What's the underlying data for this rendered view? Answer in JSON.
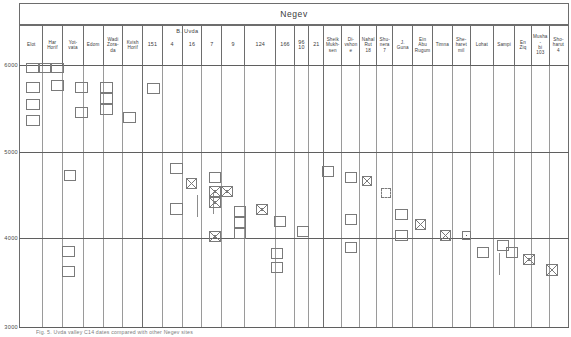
{
  "figure": {
    "title": "Negev",
    "caption": "Fig. 5. Uvda valley C14 dates compared with other Negev sites"
  },
  "axis": {
    "label": "cal BC",
    "ticks": [
      {
        "value": "6000",
        "y": 65
      },
      {
        "value": "5000",
        "y": 152
      },
      {
        "value": "4000",
        "y": 238
      },
      {
        "value": "3000",
        "y": 327
      }
    ],
    "ymin": 3000,
    "ymax": 6000,
    "gridlines": [
      65,
      152,
      238,
      327
    ]
  },
  "groups": [
    {
      "label": "B. Uvda",
      "x": 146,
      "width": 158
    }
  ],
  "columns": [
    {
      "name": "Elot",
      "label": "Elot",
      "x": 23,
      "width": 25,
      "numeric": false
    },
    {
      "name": "har-horif",
      "label": "Har\nHorif",
      "x": 48,
      "width": 25,
      "numeric": false
    },
    {
      "name": "yotvata",
      "label": "Yot-\nvata",
      "x": 73,
      "width": 25,
      "numeric": false
    },
    {
      "name": "edom",
      "label": "Edom",
      "x": 98,
      "width": 24,
      "numeric": false
    },
    {
      "name": "wadi-zora",
      "label": "Wadi\nZora-\nda",
      "x": 122,
      "width": 24,
      "numeric": false
    },
    {
      "name": "kvish-horif",
      "label": "Kvish\nHorif",
      "x": 146,
      "width": 24,
      "numeric": false
    },
    {
      "name": "uvda-151",
      "label": "151",
      "x": 170,
      "width": 24,
      "numeric": true
    },
    {
      "name": "uvda-4",
      "label": "4",
      "x": 194,
      "width": 24,
      "numeric": true
    },
    {
      "name": "uvda-16",
      "label": "16",
      "x": 218,
      "width": 24,
      "numeric": true
    },
    {
      "name": "uvda-7",
      "label": "7",
      "x": 242,
      "width": 24,
      "numeric": true
    },
    {
      "name": "uvda-9",
      "label": "9",
      "x": 266,
      "width": 28,
      "numeric": true
    },
    {
      "name": "uvda-124",
      "label": "124",
      "x": 294,
      "width": 38,
      "numeric": true
    },
    {
      "name": "uvda-166",
      "label": "166",
      "x": 332,
      "width": 22,
      "numeric": true
    },
    {
      "name": "uvda-96",
      "label": "96\n10",
      "x": 354,
      "width": 18,
      "numeric": true
    },
    {
      "name": "uvda-21",
      "label": "21",
      "x": 372,
      "width": 18,
      "numeric": true
    },
    {
      "name": "sheik-mukhsen",
      "label": "Sheik\nMukh-\nsen",
      "x": 390,
      "width": 22,
      "numeric": false
    },
    {
      "name": "divshone",
      "label": "Di-\nvshone",
      "x": 412,
      "width": 22,
      "numeric": false
    },
    {
      "name": "nahal-rut",
      "label": "Nahal\nRut\n18",
      "x": 434,
      "width": 20,
      "numeric": false
    },
    {
      "name": "shunera",
      "label": "Shu-\nnera\n7",
      "x": 454,
      "width": 20,
      "numeric": false
    },
    {
      "name": "j-guna",
      "label": "J.\nGuna",
      "x": 474,
      "width": 24,
      "numeric": false
    },
    {
      "name": "ein-abu-rugum",
      "label": "Ein\nAbu\nRugum",
      "x": 498,
      "width": 24,
      "numeric": false
    },
    {
      "name": "timna",
      "label": "Timna",
      "x": 522,
      "width": 24,
      "numeric": false
    },
    {
      "name": "sheharet",
      "label": "She-\nharet\nmil",
      "x": 546,
      "width": 22,
      "numeric": false
    },
    {
      "name": "lohat",
      "label": "Lohat",
      "x": 568,
      "width": 28,
      "numeric": false
    },
    {
      "name": "sampi",
      "label": "Sampi",
      "x": 596,
      "width": 26,
      "numeric": false
    },
    {
      "name": "en-ziq",
      "label": "En\nZiq",
      "x": 622,
      "width": 20,
      "numeric": false
    },
    {
      "name": "mushabi-103",
      "label": "Musha-\nbi\n103",
      "x": 642,
      "width": 22,
      "numeric": false
    },
    {
      "name": "shoharut-4",
      "label": "Sho-\nharut\n4",
      "x": 664,
      "width": 22,
      "numeric": false
    }
  ],
  "chart_data": {
    "type": "bar",
    "title": "Negev",
    "xlabel": "",
    "ylabel": "cal BC",
    "ylim": [
      3000,
      6000
    ],
    "grid": true,
    "legend": "none",
    "note": "Horizontal-range chart: each small rectangle marks one radiocarbon date range for the site column it sits in. Crossed (X) rectangles mark one class of sample, plain rectangles another, dashed rectangles uncertain.",
    "categories": [
      "Elot",
      "Har Horif",
      "Yotvata",
      "Edom",
      "Wadi Zorada",
      "Kvish Horif",
      "151",
      "4",
      "16",
      "7",
      "9",
      "124",
      "166",
      "96/10",
      "21",
      "Sheik Mukhsen",
      "Divshone",
      "Nahal Rut 18",
      "Shunera 7",
      "J. Guna",
      "Ein Abu Rugum",
      "Timna",
      "Sheharet mil",
      "Lohat",
      "Sampi",
      "En Ziq",
      "Mushabi 103",
      "Shoharut 4"
    ],
    "series": [
      {
        "name": "date-ranges",
        "points": [
          {
            "col": "Elot",
            "from": 6000,
            "to": 5880,
            "mark": "plain"
          },
          {
            "col": "Elot",
            "from": 5760,
            "to": 5620,
            "mark": "plain"
          },
          {
            "col": "Elot",
            "from": 5560,
            "to": 5430,
            "mark": "plain"
          },
          {
            "col": "Har Horif",
            "from": 6000,
            "to": 5870,
            "mark": "plain"
          },
          {
            "col": "Har Horif",
            "from": 4850,
            "to": 4720,
            "mark": "plain"
          },
          {
            "col": "Har Horif",
            "from": 3860,
            "to": 3720,
            "mark": "plain"
          },
          {
            "col": "Yotvata",
            "from": 5790,
            "to": 5660,
            "mark": "plain"
          },
          {
            "col": "Edom",
            "from": 5790,
            "to": 5650,
            "mark": "plain"
          },
          {
            "col": "Edom",
            "from": 5590,
            "to": 5470,
            "mark": "plain"
          },
          {
            "col": "Wadi Zorada",
            "from": 5400,
            "to": 5270,
            "mark": "plain"
          },
          {
            "col": "Kvish Horif",
            "from": 5700,
            "to": 5560,
            "mark": "plain"
          },
          {
            "col": "151",
            "from": 4830,
            "to": 4700,
            "mark": "plain"
          },
          {
            "col": "151",
            "from": 4460,
            "to": 4330,
            "mark": "plain"
          },
          {
            "col": "4",
            "from": 4790,
            "to": 4660,
            "mark": "xed"
          },
          {
            "col": "16",
            "from": 4800,
            "to": 4670,
            "mark": "plain"
          },
          {
            "col": "16",
            "from": 4690,
            "to": 4560,
            "mark": "xed"
          },
          {
            "col": "16",
            "from": 4600,
            "to": 4470,
            "mark": "xed"
          },
          {
            "col": "16",
            "from": 4110,
            "to": 3980,
            "mark": "xed"
          },
          {
            "col": "7",
            "from": 4690,
            "to": 4560,
            "mark": "xed"
          },
          {
            "col": "9",
            "from": 4470,
            "to": 4340,
            "mark": "plain"
          },
          {
            "col": "9",
            "from": 4390,
            "to": 4260,
            "mark": "plain"
          },
          {
            "col": "9",
            "from": 4300,
            "to": 4170,
            "mark": "plain"
          },
          {
            "col": "124",
            "from": 4440,
            "to": 4310,
            "mark": "xed"
          },
          {
            "col": "166",
            "from": 4310,
            "to": 4180,
            "mark": "plain"
          },
          {
            "col": "96/10",
            "from": 3930,
            "to": 3800,
            "mark": "plain"
          },
          {
            "col": "96/10",
            "from": 3820,
            "to": 3700,
            "mark": "plain"
          },
          {
            "col": "21",
            "from": 4240,
            "to": 4110,
            "mark": "plain"
          },
          {
            "col": "Sheik Mukhsen",
            "from": 4900,
            "to": 4770,
            "mark": "plain"
          },
          {
            "col": "Divshone",
            "from": 4790,
            "to": 4660,
            "mark": "plain"
          },
          {
            "col": "Divshone",
            "from": 4160,
            "to": 4030,
            "mark": "plain"
          },
          {
            "col": "Divshone",
            "from": 3880,
            "to": 3750,
            "mark": "plain"
          },
          {
            "col": "Nahal Rut 18",
            "from": 4810,
            "to": 4680,
            "mark": "xed"
          },
          {
            "col": "Shunera 7",
            "from": 4690,
            "to": 4570,
            "mark": "dashed"
          },
          {
            "col": "J. Guna",
            "from": 4310,
            "to": 4180,
            "mark": "plain"
          },
          {
            "col": "J. Guna",
            "from": 4100,
            "to": 3970,
            "mark": "plain"
          },
          {
            "col": "Ein Abu Rugum",
            "from": 4230,
            "to": 4100,
            "mark": "xed"
          },
          {
            "col": "Timna",
            "from": 4060,
            "to": 3930,
            "mark": "xed"
          },
          {
            "col": "Sheharet mil",
            "from": 4040,
            "to": 3910,
            "mark": "dot"
          },
          {
            "col": "Lohat",
            "from": 3920,
            "to": 3790,
            "mark": "plain"
          },
          {
            "col": "Sampi",
            "from": 4000,
            "to": 3870,
            "mark": "plain"
          },
          {
            "col": "Sampi",
            "from": 3960,
            "to": 3830,
            "mark": "plain"
          },
          {
            "col": "En Ziq",
            "from": 3880,
            "to": 3750,
            "mark": "plain"
          },
          {
            "col": "Mushabi 103",
            "from": 3760,
            "to": 3630,
            "mark": "xed"
          },
          {
            "col": "Shoharut 4",
            "from": 3640,
            "to": 3510,
            "mark": "xed"
          }
        ]
      }
    ]
  },
  "boxes": [
    {
      "x": 26,
      "y": 63,
      "w": 13,
      "h": 10,
      "mark": "plain"
    },
    {
      "x": 39,
      "y": 63,
      "w": 12,
      "h": 10,
      "mark": "plain"
    },
    {
      "x": 26,
      "y": 82,
      "w": 14,
      "h": 11,
      "mark": "plain"
    },
    {
      "x": 26,
      "y": 99,
      "w": 14,
      "h": 11,
      "mark": "plain"
    },
    {
      "x": 26,
      "y": 115,
      "w": 14,
      "h": 11,
      "mark": "plain"
    },
    {
      "x": 51,
      "y": 63,
      "w": 13,
      "h": 10,
      "mark": "plain"
    },
    {
      "x": 51,
      "y": 80,
      "w": 13,
      "h": 11,
      "mark": "plain"
    },
    {
      "x": 64,
      "y": 170,
      "w": 12,
      "h": 11,
      "mark": "plain"
    },
    {
      "x": 62,
      "y": 246,
      "w": 13,
      "h": 11,
      "mark": "plain"
    },
    {
      "x": 62,
      "y": 266,
      "w": 13,
      "h": 11,
      "mark": "plain"
    },
    {
      "x": 75,
      "y": 82,
      "w": 13,
      "h": 11,
      "mark": "plain"
    },
    {
      "x": 75,
      "y": 107,
      "w": 13,
      "h": 11,
      "mark": "plain"
    },
    {
      "x": 100,
      "y": 82,
      "w": 13,
      "h": 11,
      "mark": "plain"
    },
    {
      "x": 100,
      "y": 93,
      "w": 13,
      "h": 11,
      "mark": "plain"
    },
    {
      "x": 100,
      "y": 104,
      "w": 13,
      "h": 11,
      "mark": "plain"
    },
    {
      "x": 123,
      "y": 112,
      "w": 13,
      "h": 11,
      "mark": "plain"
    },
    {
      "x": 147,
      "y": 83,
      "w": 13,
      "h": 11,
      "mark": "plain"
    },
    {
      "x": 170,
      "y": 163,
      "w": 13,
      "h": 11,
      "mark": "plain"
    },
    {
      "x": 170,
      "y": 203,
      "w": 13,
      "h": 12,
      "mark": "plain"
    },
    {
      "x": 186,
      "y": 178,
      "w": 11,
      "h": 11,
      "mark": "xed"
    },
    {
      "x": 209,
      "y": 172,
      "w": 12,
      "h": 11,
      "mark": "plain"
    },
    {
      "x": 209,
      "y": 186,
      "w": 12,
      "h": 11,
      "mark": "xed"
    },
    {
      "x": 221,
      "y": 186,
      "w": 12,
      "h": 11,
      "mark": "xed"
    },
    {
      "x": 209,
      "y": 197,
      "w": 12,
      "h": 11,
      "mark": "xed"
    },
    {
      "x": 209,
      "y": 231,
      "w": 12,
      "h": 11,
      "mark": "xed"
    },
    {
      "x": 234,
      "y": 206,
      "w": 12,
      "h": 11,
      "mark": "plain"
    },
    {
      "x": 234,
      "y": 217,
      "w": 12,
      "h": 11,
      "mark": "plain"
    },
    {
      "x": 234,
      "y": 228,
      "w": 12,
      "h": 11,
      "mark": "plain"
    },
    {
      "x": 256,
      "y": 204,
      "w": 12,
      "h": 11,
      "mark": "xed"
    },
    {
      "x": 274,
      "y": 216,
      "w": 12,
      "h": 11,
      "mark": "plain"
    },
    {
      "x": 271,
      "y": 248,
      "w": 12,
      "h": 11,
      "mark": "plain"
    },
    {
      "x": 271,
      "y": 262,
      "w": 12,
      "h": 11,
      "mark": "plain"
    },
    {
      "x": 297,
      "y": 226,
      "w": 12,
      "h": 11,
      "mark": "plain"
    },
    {
      "x": 322,
      "y": 166,
      "w": 12,
      "h": 11,
      "mark": "plain"
    },
    {
      "x": 345,
      "y": 172,
      "w": 12,
      "h": 11,
      "mark": "plain"
    },
    {
      "x": 345,
      "y": 214,
      "w": 12,
      "h": 11,
      "mark": "plain"
    },
    {
      "x": 345,
      "y": 242,
      "w": 12,
      "h": 11,
      "mark": "plain"
    },
    {
      "x": 362,
      "y": 176,
      "w": 10,
      "h": 10,
      "mark": "xed"
    },
    {
      "x": 381,
      "y": 188,
      "w": 10,
      "h": 10,
      "mark": "dashed"
    },
    {
      "x": 395,
      "y": 209,
      "w": 13,
      "h": 11,
      "mark": "plain"
    },
    {
      "x": 395,
      "y": 230,
      "w": 13,
      "h": 11,
      "mark": "plain"
    },
    {
      "x": 415,
      "y": 219,
      "w": 11,
      "h": 11,
      "mark": "xed"
    },
    {
      "x": 440,
      "y": 230,
      "w": 11,
      "h": 11,
      "mark": "xed"
    },
    {
      "x": 462,
      "y": 231,
      "w": 9,
      "h": 9,
      "mark": "dot"
    },
    {
      "x": 477,
      "y": 247,
      "w": 12,
      "h": 11,
      "mark": "plain"
    },
    {
      "x": 497,
      "y": 240,
      "w": 12,
      "h": 11,
      "mark": "plain"
    },
    {
      "x": 506,
      "y": 247,
      "w": 12,
      "h": 11,
      "mark": "plain"
    },
    {
      "x": 523,
      "y": 254,
      "w": 12,
      "h": 11,
      "mark": "xed"
    },
    {
      "x": 546,
      "y": 264,
      "w": 12,
      "h": 12,
      "mark": "xed"
    }
  ],
  "whiskers": [
    {
      "x": 176,
      "y": 195,
      "h": 22
    },
    {
      "x": 192,
      "y": 192,
      "h": 22
    },
    {
      "x": 478,
      "y": 253,
      "h": 22
    }
  ]
}
